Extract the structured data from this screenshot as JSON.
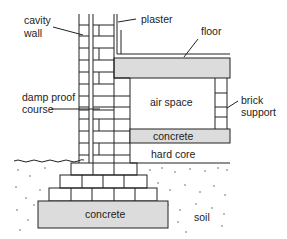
{
  "diagram": {
    "labels": {
      "cavity_wall_1": "cavity",
      "cavity_wall_2": "wall",
      "plaster": "plaster",
      "floor": "floor",
      "damp_proof_1": "damp proof",
      "damp_proof_2": "course",
      "air_space": "air space",
      "brick_support_1": "brick",
      "brick_support_2": "support",
      "concrete_slab": "concrete",
      "hard_core": "hard core",
      "concrete_footing": "concrete",
      "soil": "soil"
    },
    "colors": {
      "line": "#222222",
      "fill_gray": "#dcdcdc",
      "background": "#ffffff"
    }
  }
}
